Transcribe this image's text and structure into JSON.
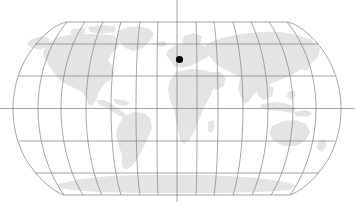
{
  "figure": {
    "name": "world-map-locator",
    "type": "map",
    "width": 355,
    "height": 202,
    "projection": "robinson",
    "background_color": "#ffffff"
  },
  "map": {
    "land_color": "#e4e4e4",
    "ocean_color": "#ffffff",
    "graticule_color": "#808080",
    "graticule_width": 0.7,
    "outline_color": "#808080",
    "bounds": {
      "left": 13,
      "right": 341,
      "top": 22,
      "bottom": 195,
      "center_x": 177,
      "center_y": 108.5
    },
    "graticule": {
      "meridian_interval_deg": 30,
      "parallel_interval_deg": 30,
      "meridians_deg": [
        -180,
        -150,
        -120,
        -90,
        -60,
        -30,
        0,
        30,
        60,
        90,
        120,
        150,
        180
      ],
      "parallels_deg": [
        60,
        30,
        0,
        -30,
        -60
      ],
      "equator_extends_full_width": true,
      "central_meridian_extends_full_height": true
    },
    "landmasses": [
      {
        "name": "north-america"
      },
      {
        "name": "south-america"
      },
      {
        "name": "europe"
      },
      {
        "name": "africa"
      },
      {
        "name": "asia"
      },
      {
        "name": "australia"
      },
      {
        "name": "antarctica"
      },
      {
        "name": "greenland"
      }
    ]
  },
  "marker": {
    "name": "location-marker",
    "shape": "circle",
    "color": "#000000",
    "radius_px": 3.6,
    "x_px": 179.5,
    "y_px": 59.5,
    "approx_longitude_deg": 2,
    "approx_latitude_deg": 52
  },
  "chart_data": {
    "type": "map",
    "title": "",
    "xlabel": "",
    "ylabel": "",
    "projection": "robinson",
    "xlim": [
      -180,
      180
    ],
    "ylim": [
      -90,
      90
    ],
    "grid": true,
    "legend": "none",
    "points": [
      {
        "label": "",
        "longitude": 2,
        "latitude": 52,
        "color": "#000000",
        "size": 7
      }
    ],
    "gridlines": {
      "meridians": [
        -180,
        -150,
        -120,
        -90,
        -60,
        -30,
        0,
        30,
        60,
        90,
        120,
        150,
        180
      ],
      "parallels": [
        60,
        30,
        0,
        -30,
        -60
      ]
    }
  }
}
